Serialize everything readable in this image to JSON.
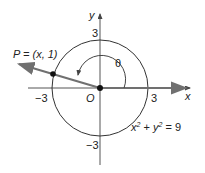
{
  "diagram": {
    "axis_labels": {
      "x": "x",
      "y": "y"
    },
    "ticks": {
      "pos_x": "3",
      "neg_x": "−3",
      "pos_y": "3",
      "neg_y": "−3"
    },
    "origin_label": "O",
    "angle_label": "θ",
    "point_label": "P = (x, 1)",
    "equation": {
      "base_x": "x",
      "exp_x": "2",
      "plus": " + ",
      "base_y": "y",
      "exp_y": "2",
      "rhs": " = 9"
    },
    "colors": {
      "terminal_ray": "#707070",
      "axes": "#555555",
      "circle": "#333333"
    }
  }
}
